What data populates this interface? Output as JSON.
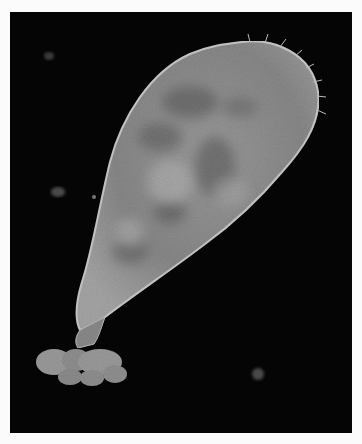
{
  "image": {
    "subject": "flask-shaped ciliate protozoan, dark-field micrograph",
    "background_color": "#050505",
    "border_color": "#fbfbfb",
    "body_color": "#8e8e8e",
    "specks": 4
  }
}
